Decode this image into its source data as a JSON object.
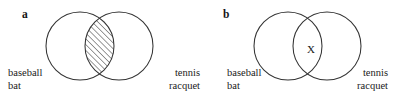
{
  "figure": {
    "caption_letters": {
      "a": "a",
      "b": "b"
    },
    "panels": [
      {
        "id": "a",
        "letter": "a",
        "left_label_line1": "baseball",
        "left_label_line2": "bat",
        "right_label_line1": "tennis",
        "right_label_line2": "racquet",
        "intersection_mark": "",
        "intersection_style": "hatched",
        "stroke_color": "#333333"
      },
      {
        "id": "b",
        "letter": "b",
        "left_label_line1": "baseball",
        "left_label_line2": "bat",
        "right_label_line1": "tennis",
        "right_label_line2": "racquet",
        "intersection_mark": "X",
        "intersection_style": "marked",
        "stroke_color": "#333333"
      }
    ]
  },
  "diagram_geometry": {
    "panel_a": {
      "circle_left": {
        "cx": 80,
        "cy": 46,
        "r": 34
      },
      "circle_right": {
        "cx": 119,
        "cy": 46,
        "r": 34
      }
    },
    "panel_b": {
      "circle_left": {
        "cx": 83,
        "cy": 46,
        "r": 34
      },
      "circle_right": {
        "cx": 122,
        "cy": 46,
        "r": 34
      }
    }
  }
}
